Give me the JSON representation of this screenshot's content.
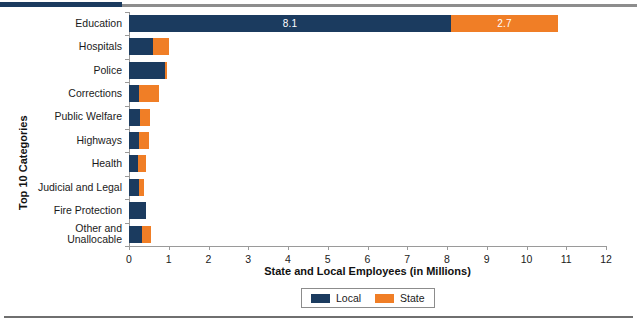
{
  "chart_data": {
    "type": "bar",
    "orientation": "horizontal",
    "stacked": true,
    "title": "",
    "xlabel": "State and Local Employees (in Millions)",
    "ylabel": "Top 10 Categories",
    "xlim": [
      0,
      12
    ],
    "xticks": [
      "0",
      "1",
      "2",
      "3",
      "4",
      "5",
      "6",
      "7",
      "8",
      "9",
      "10",
      "11",
      "12"
    ],
    "grid": false,
    "legend_position": "bottom-center",
    "categories": [
      "Education",
      "Hospitals",
      "Police",
      "Corrections",
      "Public Welfare",
      "Highways",
      "Health",
      "Judicial and Legal",
      "Fire Protection",
      "Other and Unallocable"
    ],
    "series": [
      {
        "name": "Local",
        "color": "#1b3b5f",
        "values": [
          8.1,
          0.6,
          0.9,
          0.25,
          0.28,
          0.25,
          0.23,
          0.25,
          0.42,
          0.33
        ]
      },
      {
        "name": "State",
        "color": "#f07e26",
        "values": [
          2.7,
          0.4,
          0.05,
          0.5,
          0.25,
          0.25,
          0.2,
          0.13,
          0.0,
          0.22
        ]
      }
    ],
    "data_labels": [
      {
        "category": "Education",
        "series": "Local",
        "text": "8.1"
      },
      {
        "category": "Education",
        "series": "State",
        "text": "2.7"
      }
    ]
  },
  "legend": {
    "items": [
      {
        "label": "Local",
        "color": "#1b3b5f"
      },
      {
        "label": "State",
        "color": "#f07e26"
      }
    ]
  },
  "colors": {
    "local": "#1b3b5f",
    "state": "#f07e26",
    "axis": "#9a9a9a",
    "rule": "#8d8d8d",
    "text": "#1a1a1a"
  }
}
